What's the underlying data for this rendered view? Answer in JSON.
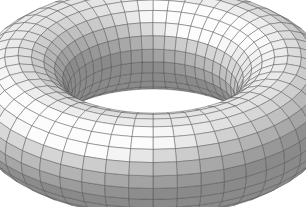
{
  "image": {
    "title": "Shaded wireframe torus",
    "subject": "torus",
    "description": "Grayscale shaded 3D torus (donut) with quadrilateral wireframe mesh, viewed obliquely from above, on a plain white background",
    "width": 306,
    "height": 207,
    "background_color": "#ffffff"
  },
  "geometry": {
    "shape": "torus",
    "major_radius": 1.0,
    "minor_radius": 0.38,
    "major_segments": 48,
    "minor_segments": 24,
    "center_x": 153,
    "center_y": 101,
    "scale": 135,
    "tilt_degrees": 62,
    "spin_degrees": 0,
    "outer_bounds": {
      "left": 18,
      "top": 10,
      "right": 288,
      "bottom": 196
    },
    "hole_bounds": {
      "left": 82,
      "top": 68,
      "right": 228,
      "bottom": 134
    }
  },
  "shading": {
    "model": "lambert-diffuse-with-specular",
    "light_direction": [
      -0.45,
      -0.72,
      0.52
    ],
    "ambient": 0.3,
    "diffuse": 0.62,
    "specular": 0.38,
    "specular_power": 14,
    "surface_light_color": "#fcfcfc",
    "surface_mid_color": "#a8a8a8",
    "surface_dark_color": "#5c5c5c",
    "wireframe_color": "#4a4a4a",
    "wireframe_width": 0.5,
    "wireframe_opacity": 0.85
  },
  "labels": {
    "figure_caption": "",
    "alt_text": "Shaded wireframe torus"
  }
}
